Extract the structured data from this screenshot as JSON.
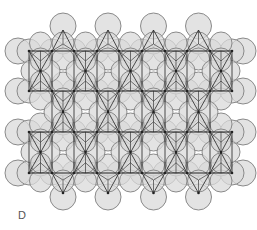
{
  "panel": {
    "label": "D"
  },
  "style": {
    "circle_fill": "#d9d9d9",
    "circle_stroke": "#8a8a8a",
    "line_color": "#222222",
    "circle_radius": 12,
    "circle_opacity": 0.75
  },
  "lattice": {
    "row_lines_y": [
      51,
      91,
      132,
      173
    ],
    "row_vertices_x": [
      29,
      52,
      74,
      97,
      119,
      142,
      165,
      187,
      210,
      232
    ],
    "bands": [
      {
        "top": 51,
        "bottom": 91,
        "center_y": 71,
        "unit_pairs": [
          [
            29,
            52
          ],
          [
            74,
            97
          ],
          [
            119,
            142
          ],
          [
            165,
            187
          ],
          [
            210,
            232
          ]
        ]
      },
      {
        "top": 91,
        "bottom": 132,
        "center_y": 112,
        "unit_pairs": [
          [
            52,
            74
          ],
          [
            97,
            119
          ],
          [
            142,
            165
          ],
          [
            187,
            210
          ]
        ]
      },
      {
        "top": 132,
        "bottom": 173,
        "center_y": 152,
        "unit_pairs": [
          [
            29,
            52
          ],
          [
            74,
            97
          ],
          [
            119,
            142
          ],
          [
            165,
            187
          ],
          [
            210,
            232
          ]
        ]
      }
    ],
    "top_apexes": {
      "y": 30,
      "pairs": [
        [
          52,
          74
        ],
        [
          97,
          119
        ],
        [
          142,
          165
        ],
        [
          187,
          210
        ]
      ],
      "base_y": 51
    },
    "bottom_apexes": {
      "y": 193,
      "pairs": [
        [
          52,
          74
        ],
        [
          97,
          119
        ],
        [
          142,
          165
        ],
        [
          187,
          210
        ]
      ],
      "base_y": 173
    },
    "side_circles": {
      "x_left": 18,
      "x_right": 243,
      "ys": [
        51,
        91,
        132,
        173
      ]
    }
  }
}
